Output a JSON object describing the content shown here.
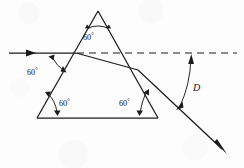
{
  "figure": {
    "background_color": "#fdfdfd",
    "line_color": "#1b1b1b",
    "width": 244,
    "height": 168
  },
  "labels": {
    "apex_angle": "60",
    "incidence_angle": "60",
    "bottom_left_angle": "60",
    "bottom_right_angle": "60",
    "degree_symbol": "°",
    "deviation_symbol": "D"
  },
  "geometry": {
    "prism": {
      "apex": [
        98,
        11
      ],
      "bottom_left": [
        37,
        118
      ],
      "bottom_right": [
        158,
        118
      ]
    },
    "incident_ray": {
      "from": [
        9,
        53
      ],
      "to": [
        76,
        53
      ],
      "arrow_at": [
        34,
        53
      ]
    },
    "internal_ray": {
      "from": [
        76,
        53
      ],
      "to": [
        138,
        70
      ]
    },
    "exit_ray": {
      "from": [
        138,
        70
      ],
      "to": [
        226,
        153
      ],
      "arrow_at": [
        226,
        153
      ]
    },
    "dashed_extension": {
      "from": [
        76,
        53
      ],
      "to": [
        237,
        53
      ]
    }
  },
  "annotations": {
    "apex_arc_label_pos": [
      92,
      31
    ],
    "incidence_label_pos": [
      37,
      71
    ],
    "bottom_left_label_pos": [
      59,
      103
    ],
    "bottom_right_label_pos": [
      126,
      103
    ],
    "deviation_label_pos": [
      192,
      87
    ]
  }
}
